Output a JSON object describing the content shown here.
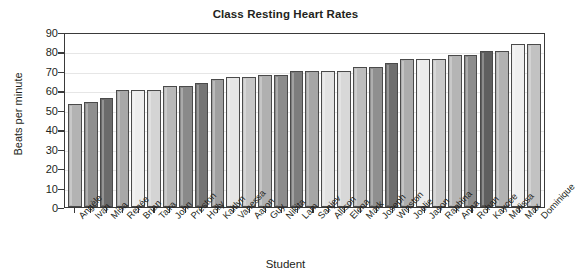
{
  "chart_data": {
    "type": "bar",
    "title": "Class Resting Heart Rates",
    "xlabel": "Student",
    "ylabel": "Beats per minute",
    "ylim": [
      0,
      90
    ],
    "ytick_step": 10,
    "yticks": [
      0,
      10,
      20,
      30,
      40,
      50,
      60,
      70,
      80,
      90
    ],
    "grid": "horizontal",
    "legend": "none",
    "categories": [
      "Angèle",
      "Ivan",
      "Misa",
      "Renée",
      "Brian",
      "Taira",
      "John",
      "Preston",
      "Holly",
      "Kaitlyn",
      "Vanessa",
      "Aaron",
      "Guy",
      "Nikita",
      "Lam",
      "Sanjev",
      "Allison",
      "Elena",
      "Mark",
      "Joseph",
      "Winston",
      "Joelie",
      "Jason",
      "Raphina",
      "Anna",
      "Rohan",
      "Kaycee",
      "Melissa",
      "Max",
      "Dominique"
    ],
    "values": [
      53,
      54,
      56,
      60,
      60,
      60,
      62,
      62,
      64,
      66,
      67,
      67,
      68,
      68,
      70,
      70,
      70,
      70,
      72,
      72,
      74,
      76,
      76,
      76,
      78,
      78,
      80,
      80,
      84,
      84
    ],
    "bar_shades": [
      "#b3b3b3",
      "#8f8f8f",
      "#6b6b6b",
      "#a8a8a8",
      "#ededed",
      "#d4d4d4",
      "#b8b8b8",
      "#8a8a8a",
      "#757575",
      "#a0a0a0",
      "#e6e6e6",
      "#c6c6c6",
      "#b0b0b0",
      "#8c8c8c",
      "#7d7d7d",
      "#a6a6a6",
      "#e2e2e2",
      "#d8d8d8",
      "#bdbdbd",
      "#8f8f8f",
      "#6f6f6f",
      "#adadad",
      "#ececec",
      "#c9c9c9",
      "#b5b5b5",
      "#8d8d8d",
      "#5f5f5f",
      "#b2b2b2",
      "#efefef",
      "#c2c2c2"
    ],
    "bar_edge_color": "#4a4a4a",
    "axis_color": "#3a3a3a",
    "grid_color": "#e6e6e6",
    "text_color": "#231f20",
    "background": "#ffffff"
  }
}
